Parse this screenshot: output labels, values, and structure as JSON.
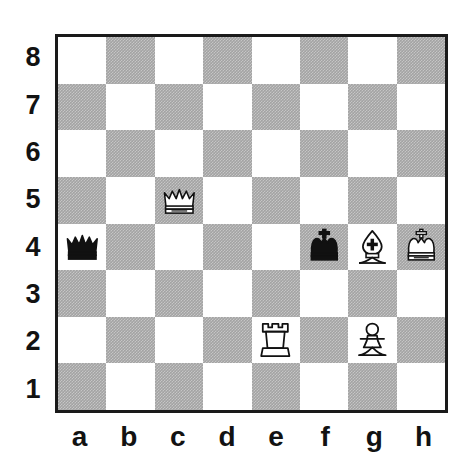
{
  "board": {
    "orientation": "white-bottom",
    "light_square_color": "#ffffff",
    "dark_square_color": "#a3a3a3",
    "border_color": "#1a1a1a",
    "label_color": "#121212",
    "file_labels": [
      "a",
      "b",
      "c",
      "d",
      "e",
      "f",
      "g",
      "h"
    ],
    "rank_labels": [
      "8",
      "7",
      "6",
      "5",
      "4",
      "3",
      "2",
      "1"
    ],
    "squares": [
      {
        "square": "a8",
        "shade": "light",
        "piece": null
      },
      {
        "square": "b8",
        "shade": "dark",
        "piece": null
      },
      {
        "square": "c8",
        "shade": "light",
        "piece": null
      },
      {
        "square": "d8",
        "shade": "dark",
        "piece": null
      },
      {
        "square": "e8",
        "shade": "light",
        "piece": null
      },
      {
        "square": "f8",
        "shade": "dark",
        "piece": null
      },
      {
        "square": "g8",
        "shade": "light",
        "piece": null
      },
      {
        "square": "h8",
        "shade": "dark",
        "piece": null
      },
      {
        "square": "a7",
        "shade": "dark",
        "piece": null
      },
      {
        "square": "b7",
        "shade": "light",
        "piece": null
      },
      {
        "square": "c7",
        "shade": "dark",
        "piece": null
      },
      {
        "square": "d7",
        "shade": "light",
        "piece": null
      },
      {
        "square": "e7",
        "shade": "dark",
        "piece": null
      },
      {
        "square": "f7",
        "shade": "light",
        "piece": null
      },
      {
        "square": "g7",
        "shade": "dark",
        "piece": null
      },
      {
        "square": "h7",
        "shade": "light",
        "piece": null
      },
      {
        "square": "a6",
        "shade": "light",
        "piece": null
      },
      {
        "square": "b6",
        "shade": "dark",
        "piece": null
      },
      {
        "square": "c6",
        "shade": "light",
        "piece": null
      },
      {
        "square": "d6",
        "shade": "dark",
        "piece": null
      },
      {
        "square": "e6",
        "shade": "light",
        "piece": null
      },
      {
        "square": "f6",
        "shade": "dark",
        "piece": null
      },
      {
        "square": "g6",
        "shade": "light",
        "piece": null
      },
      {
        "square": "h6",
        "shade": "dark",
        "piece": null
      },
      {
        "square": "a5",
        "shade": "dark",
        "piece": null
      },
      {
        "square": "b5",
        "shade": "light",
        "piece": null
      },
      {
        "square": "c5",
        "shade": "dark",
        "piece": {
          "color": "white",
          "type": "queen",
          "name": "white-queen"
        }
      },
      {
        "square": "d5",
        "shade": "light",
        "piece": null
      },
      {
        "square": "e5",
        "shade": "dark",
        "piece": null
      },
      {
        "square": "f5",
        "shade": "light",
        "piece": null
      },
      {
        "square": "g5",
        "shade": "dark",
        "piece": null
      },
      {
        "square": "h5",
        "shade": "light",
        "piece": null
      },
      {
        "square": "a4",
        "shade": "light",
        "piece": {
          "color": "black",
          "type": "queen",
          "name": "black-queen"
        }
      },
      {
        "square": "b4",
        "shade": "dark",
        "piece": null
      },
      {
        "square": "c4",
        "shade": "light",
        "piece": null
      },
      {
        "square": "d4",
        "shade": "dark",
        "piece": null
      },
      {
        "square": "e4",
        "shade": "light",
        "piece": null
      },
      {
        "square": "f4",
        "shade": "dark",
        "piece": {
          "color": "black",
          "type": "king",
          "name": "black-king"
        }
      },
      {
        "square": "g4",
        "shade": "light",
        "piece": {
          "color": "white",
          "type": "bishop",
          "name": "white-bishop"
        }
      },
      {
        "square": "h4",
        "shade": "dark",
        "piece": {
          "color": "white",
          "type": "king",
          "name": "white-king"
        }
      },
      {
        "square": "a3",
        "shade": "dark",
        "piece": null
      },
      {
        "square": "b3",
        "shade": "light",
        "piece": null
      },
      {
        "square": "c3",
        "shade": "dark",
        "piece": null
      },
      {
        "square": "d3",
        "shade": "light",
        "piece": null
      },
      {
        "square": "e3",
        "shade": "dark",
        "piece": null
      },
      {
        "square": "f3",
        "shade": "light",
        "piece": null
      },
      {
        "square": "g3",
        "shade": "dark",
        "piece": null
      },
      {
        "square": "h3",
        "shade": "light",
        "piece": null
      },
      {
        "square": "a2",
        "shade": "light",
        "piece": null
      },
      {
        "square": "b2",
        "shade": "dark",
        "piece": null
      },
      {
        "square": "c2",
        "shade": "light",
        "piece": null
      },
      {
        "square": "d2",
        "shade": "dark",
        "piece": null
      },
      {
        "square": "e2",
        "shade": "light",
        "piece": {
          "color": "white",
          "type": "rook",
          "name": "white-rook"
        }
      },
      {
        "square": "f2",
        "shade": "dark",
        "piece": null
      },
      {
        "square": "g2",
        "shade": "light",
        "piece": {
          "color": "white",
          "type": "pawn",
          "name": "white-pawn"
        }
      },
      {
        "square": "h2",
        "shade": "dark",
        "piece": null
      },
      {
        "square": "a1",
        "shade": "dark",
        "piece": null
      },
      {
        "square": "b1",
        "shade": "light",
        "piece": null
      },
      {
        "square": "c1",
        "shade": "dark",
        "piece": null
      },
      {
        "square": "d1",
        "shade": "light",
        "piece": null
      },
      {
        "square": "e1",
        "shade": "dark",
        "piece": null
      },
      {
        "square": "f1",
        "shade": "light",
        "piece": null
      },
      {
        "square": "g1",
        "shade": "dark",
        "piece": null
      },
      {
        "square": "h1",
        "shade": "light",
        "piece": null
      }
    ],
    "position_summary": {
      "white_pieces": [
        "Qc5",
        "Bg4",
        "Kh4",
        "Re2",
        "Pg2"
      ],
      "black_pieces": [
        "Qa4",
        "Kf4"
      ]
    }
  }
}
